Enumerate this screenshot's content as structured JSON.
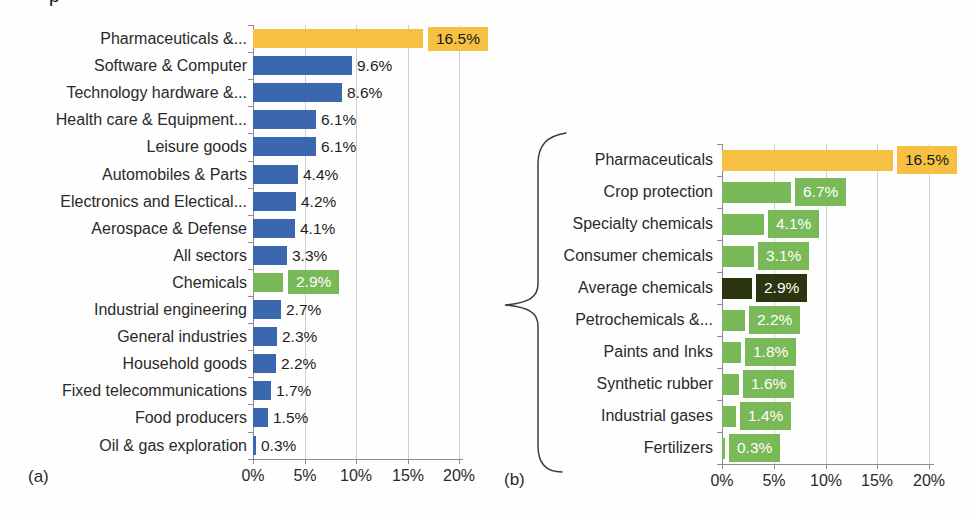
{
  "page": {
    "fragment_top": "p",
    "panel_a_tag": "(a)",
    "panel_b_tag": "(b)"
  },
  "colors": {
    "yellow": "#F6C143",
    "blue": "#3A67AE",
    "green": "#7AB957",
    "dark_green": "#2B350F",
    "grid": "#CFCFCF",
    "axis": "#8C8C8C",
    "text": "#2A2A2A",
    "box_text_light": "#FFFFFF",
    "box_text_dark": "#1A1A1A"
  },
  "chart_data": [
    {
      "id": "a",
      "type": "bar",
      "orientation": "horizontal",
      "panel_label": "(a)",
      "xlim": [
        0,
        20
      ],
      "tick_values": [
        0,
        5,
        10,
        15,
        20
      ],
      "tick_labels": [
        "0%",
        "5%",
        "10%",
        "15%",
        "20%"
      ],
      "grid": "vertical",
      "bars": [
        {
          "label": "Pharmaceuticals &...",
          "value": 16.5,
          "display": "16.5%",
          "color": "yellow",
          "value_style": "box",
          "value_text": "dark"
        },
        {
          "label": "Software & Computer",
          "value": 9.6,
          "display": "9.6%",
          "color": "blue",
          "value_style": "plain"
        },
        {
          "label": "Technology hardware &...",
          "value": 8.6,
          "display": "8.6%",
          "color": "blue",
          "value_style": "plain"
        },
        {
          "label": "Health care & Equipment...",
          "value": 6.1,
          "display": "6.1%",
          "color": "blue",
          "value_style": "plain"
        },
        {
          "label": "Leisure goods",
          "value": 6.1,
          "display": "6.1%",
          "color": "blue",
          "value_style": "plain"
        },
        {
          "label": "Automobiles & Parts",
          "value": 4.4,
          "display": "4.4%",
          "color": "blue",
          "value_style": "plain"
        },
        {
          "label": "Electronics and Electical...",
          "value": 4.2,
          "display": "4.2%",
          "color": "blue",
          "value_style": "plain"
        },
        {
          "label": "Aerospace & Defense",
          "value": 4.1,
          "display": "4.1%",
          "color": "blue",
          "value_style": "plain"
        },
        {
          "label": "All sectors",
          "value": 3.3,
          "display": "3.3%",
          "color": "blue",
          "value_style": "plain"
        },
        {
          "label": "Chemicals",
          "value": 2.9,
          "display": "2.9%",
          "color": "green",
          "value_style": "box",
          "value_text": "light"
        },
        {
          "label": "Industrial engineering",
          "value": 2.7,
          "display": "2.7%",
          "color": "blue",
          "value_style": "plain"
        },
        {
          "label": "General industries",
          "value": 2.3,
          "display": "2.3%",
          "color": "blue",
          "value_style": "plain"
        },
        {
          "label": "Household goods",
          "value": 2.2,
          "display": "2.2%",
          "color": "blue",
          "value_style": "plain"
        },
        {
          "label": "Fixed telecommunications",
          "value": 1.7,
          "display": "1.7%",
          "color": "blue",
          "value_style": "plain"
        },
        {
          "label": "Food producers",
          "value": 1.5,
          "display": "1.5%",
          "color": "blue",
          "value_style": "plain"
        },
        {
          "label": "Oil & gas exploration",
          "value": 0.3,
          "display": "0.3%",
          "color": "blue",
          "value_style": "plain"
        }
      ]
    },
    {
      "id": "b",
      "type": "bar",
      "orientation": "horizontal",
      "panel_label": "(b)",
      "xlim": [
        0,
        20
      ],
      "tick_values": [
        0,
        5,
        10,
        15,
        20
      ],
      "tick_labels": [
        "0%",
        "5%",
        "10%",
        "15%",
        "20%"
      ],
      "grid": "vertical",
      "bars": [
        {
          "label": "Pharmaceuticals",
          "value": 16.5,
          "display": "16.5%",
          "color": "yellow",
          "value_style": "box",
          "value_text": "dark"
        },
        {
          "label": "Crop protection",
          "value": 6.7,
          "display": "6.7%",
          "color": "green",
          "value_style": "box",
          "value_text": "light"
        },
        {
          "label": "Specialty chemicals",
          "value": 4.1,
          "display": "4.1%",
          "color": "green",
          "value_style": "box",
          "value_text": "light"
        },
        {
          "label": "Consumer chemicals",
          "value": 3.1,
          "display": "3.1%",
          "color": "green",
          "value_style": "box",
          "value_text": "light"
        },
        {
          "label": "Average chemicals",
          "value": 2.9,
          "display": "2.9%",
          "color": "dark_green",
          "value_style": "box",
          "value_text": "light"
        },
        {
          "label": "Petrochemicals &...",
          "value": 2.2,
          "display": "2.2%",
          "color": "green",
          "value_style": "box",
          "value_text": "light"
        },
        {
          "label": "Paints and Inks",
          "value": 1.8,
          "display": "1.8%",
          "color": "green",
          "value_style": "box",
          "value_text": "light"
        },
        {
          "label": "Synthetic rubber",
          "value": 1.6,
          "display": "1.6%",
          "color": "green",
          "value_style": "box",
          "value_text": "light"
        },
        {
          "label": "Industrial gases",
          "value": 1.4,
          "display": "1.4%",
          "color": "green",
          "value_style": "box",
          "value_text": "light"
        },
        {
          "label": "Fertilizers",
          "value": 0.3,
          "display": "0.3%",
          "color": "green",
          "value_style": "box",
          "value_text": "light"
        }
      ]
    }
  ]
}
